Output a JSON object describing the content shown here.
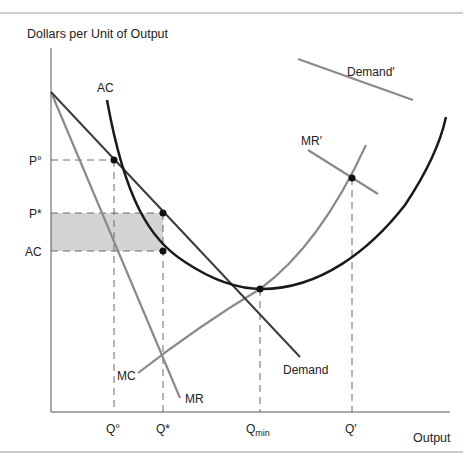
{
  "figure": {
    "y_axis_label": "Dollars per Unit of Output",
    "x_axis_label": "Output",
    "curve_labels": {
      "ac": "AC",
      "mc": "MC",
      "mr": "MR",
      "demand": "Demand",
      "demand_prime": "Demand′",
      "mr_prime": "MR′"
    },
    "y_ticks": {
      "p_zero": "P°",
      "p_star": "P*",
      "ac_level": "AC"
    },
    "x_ticks": {
      "q_zero": "Q°",
      "q_star": "Q*",
      "q_min_base": "Q",
      "q_min_sub": "min",
      "q_prime": "Q′"
    },
    "colors": {
      "ac_curve": "#1a1a1a",
      "demand_curve": "#3a3a3a",
      "gray_curves": "#8a8a8a",
      "shaded_profit": "#d4d4d4",
      "dashed": "#6a6a6a",
      "axis": "#555555"
    }
  }
}
